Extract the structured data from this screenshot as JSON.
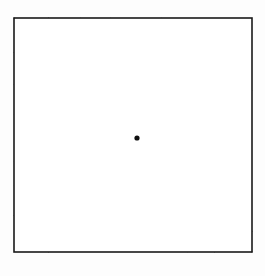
{
  "figure": {
    "title": "Dashed radial starburst over dashed grid inside a square",
    "type": "geometric-diagram",
    "canvas": {
      "width": 265,
      "height": 276
    },
    "background_color": "#fdfdfd",
    "ink_color": "#1f1f1f",
    "border_color": "#1a1a1a"
  },
  "chart_data": {
    "type": "diagram",
    "title": "Dashed radial starburst over dashed grid inside a square",
    "xlabel": "",
    "ylabel": "",
    "grid": true,
    "legend": "none",
    "xlim": [
      14,
      252
    ],
    "ylim": [
      18,
      252
    ],
    "square": {
      "x0": 14,
      "y0": 18,
      "x1": 252,
      "y1": 252,
      "stroke": "#1a1a1a",
      "stroke_width": 1.6,
      "style": "solid"
    },
    "center": {
      "x": 137,
      "y": 138
    },
    "line_style": {
      "dash": "7 5",
      "stroke": "#1f1f1f",
      "stroke_width": 1.7
    },
    "grid_vertical_x": [
      62,
      110,
      136,
      162,
      188,
      206
    ],
    "grid_horizontal_y": [
      66,
      114,
      138,
      162,
      211
    ],
    "radial_endpoints": [
      {
        "x": 137,
        "y": 18
      },
      {
        "x": 162,
        "y": 18
      },
      {
        "x": 188,
        "y": 18
      },
      {
        "x": 215,
        "y": 18
      },
      {
        "x": 252,
        "y": 18
      },
      {
        "x": 252,
        "y": 52
      },
      {
        "x": 252,
        "y": 90
      },
      {
        "x": 252,
        "y": 114
      },
      {
        "x": 252,
        "y": 138
      },
      {
        "x": 252,
        "y": 162
      },
      {
        "x": 252,
        "y": 196
      },
      {
        "x": 252,
        "y": 232
      },
      {
        "x": 252,
        "y": 252
      },
      {
        "x": 215,
        "y": 252
      },
      {
        "x": 188,
        "y": 252
      },
      {
        "x": 162,
        "y": 252
      },
      {
        "x": 137,
        "y": 252
      },
      {
        "x": 110,
        "y": 252
      },
      {
        "x": 80,
        "y": 252
      },
      {
        "x": 48,
        "y": 252
      },
      {
        "x": 14,
        "y": 252
      },
      {
        "x": 14,
        "y": 216
      },
      {
        "x": 14,
        "y": 186
      },
      {
        "x": 14,
        "y": 162
      },
      {
        "x": 14,
        "y": 138
      },
      {
        "x": 14,
        "y": 114
      },
      {
        "x": 14,
        "y": 84
      },
      {
        "x": 14,
        "y": 52
      },
      {
        "x": 14,
        "y": 18
      },
      {
        "x": 48,
        "y": 18
      },
      {
        "x": 80,
        "y": 18
      },
      {
        "x": 110,
        "y": 18
      }
    ]
  }
}
